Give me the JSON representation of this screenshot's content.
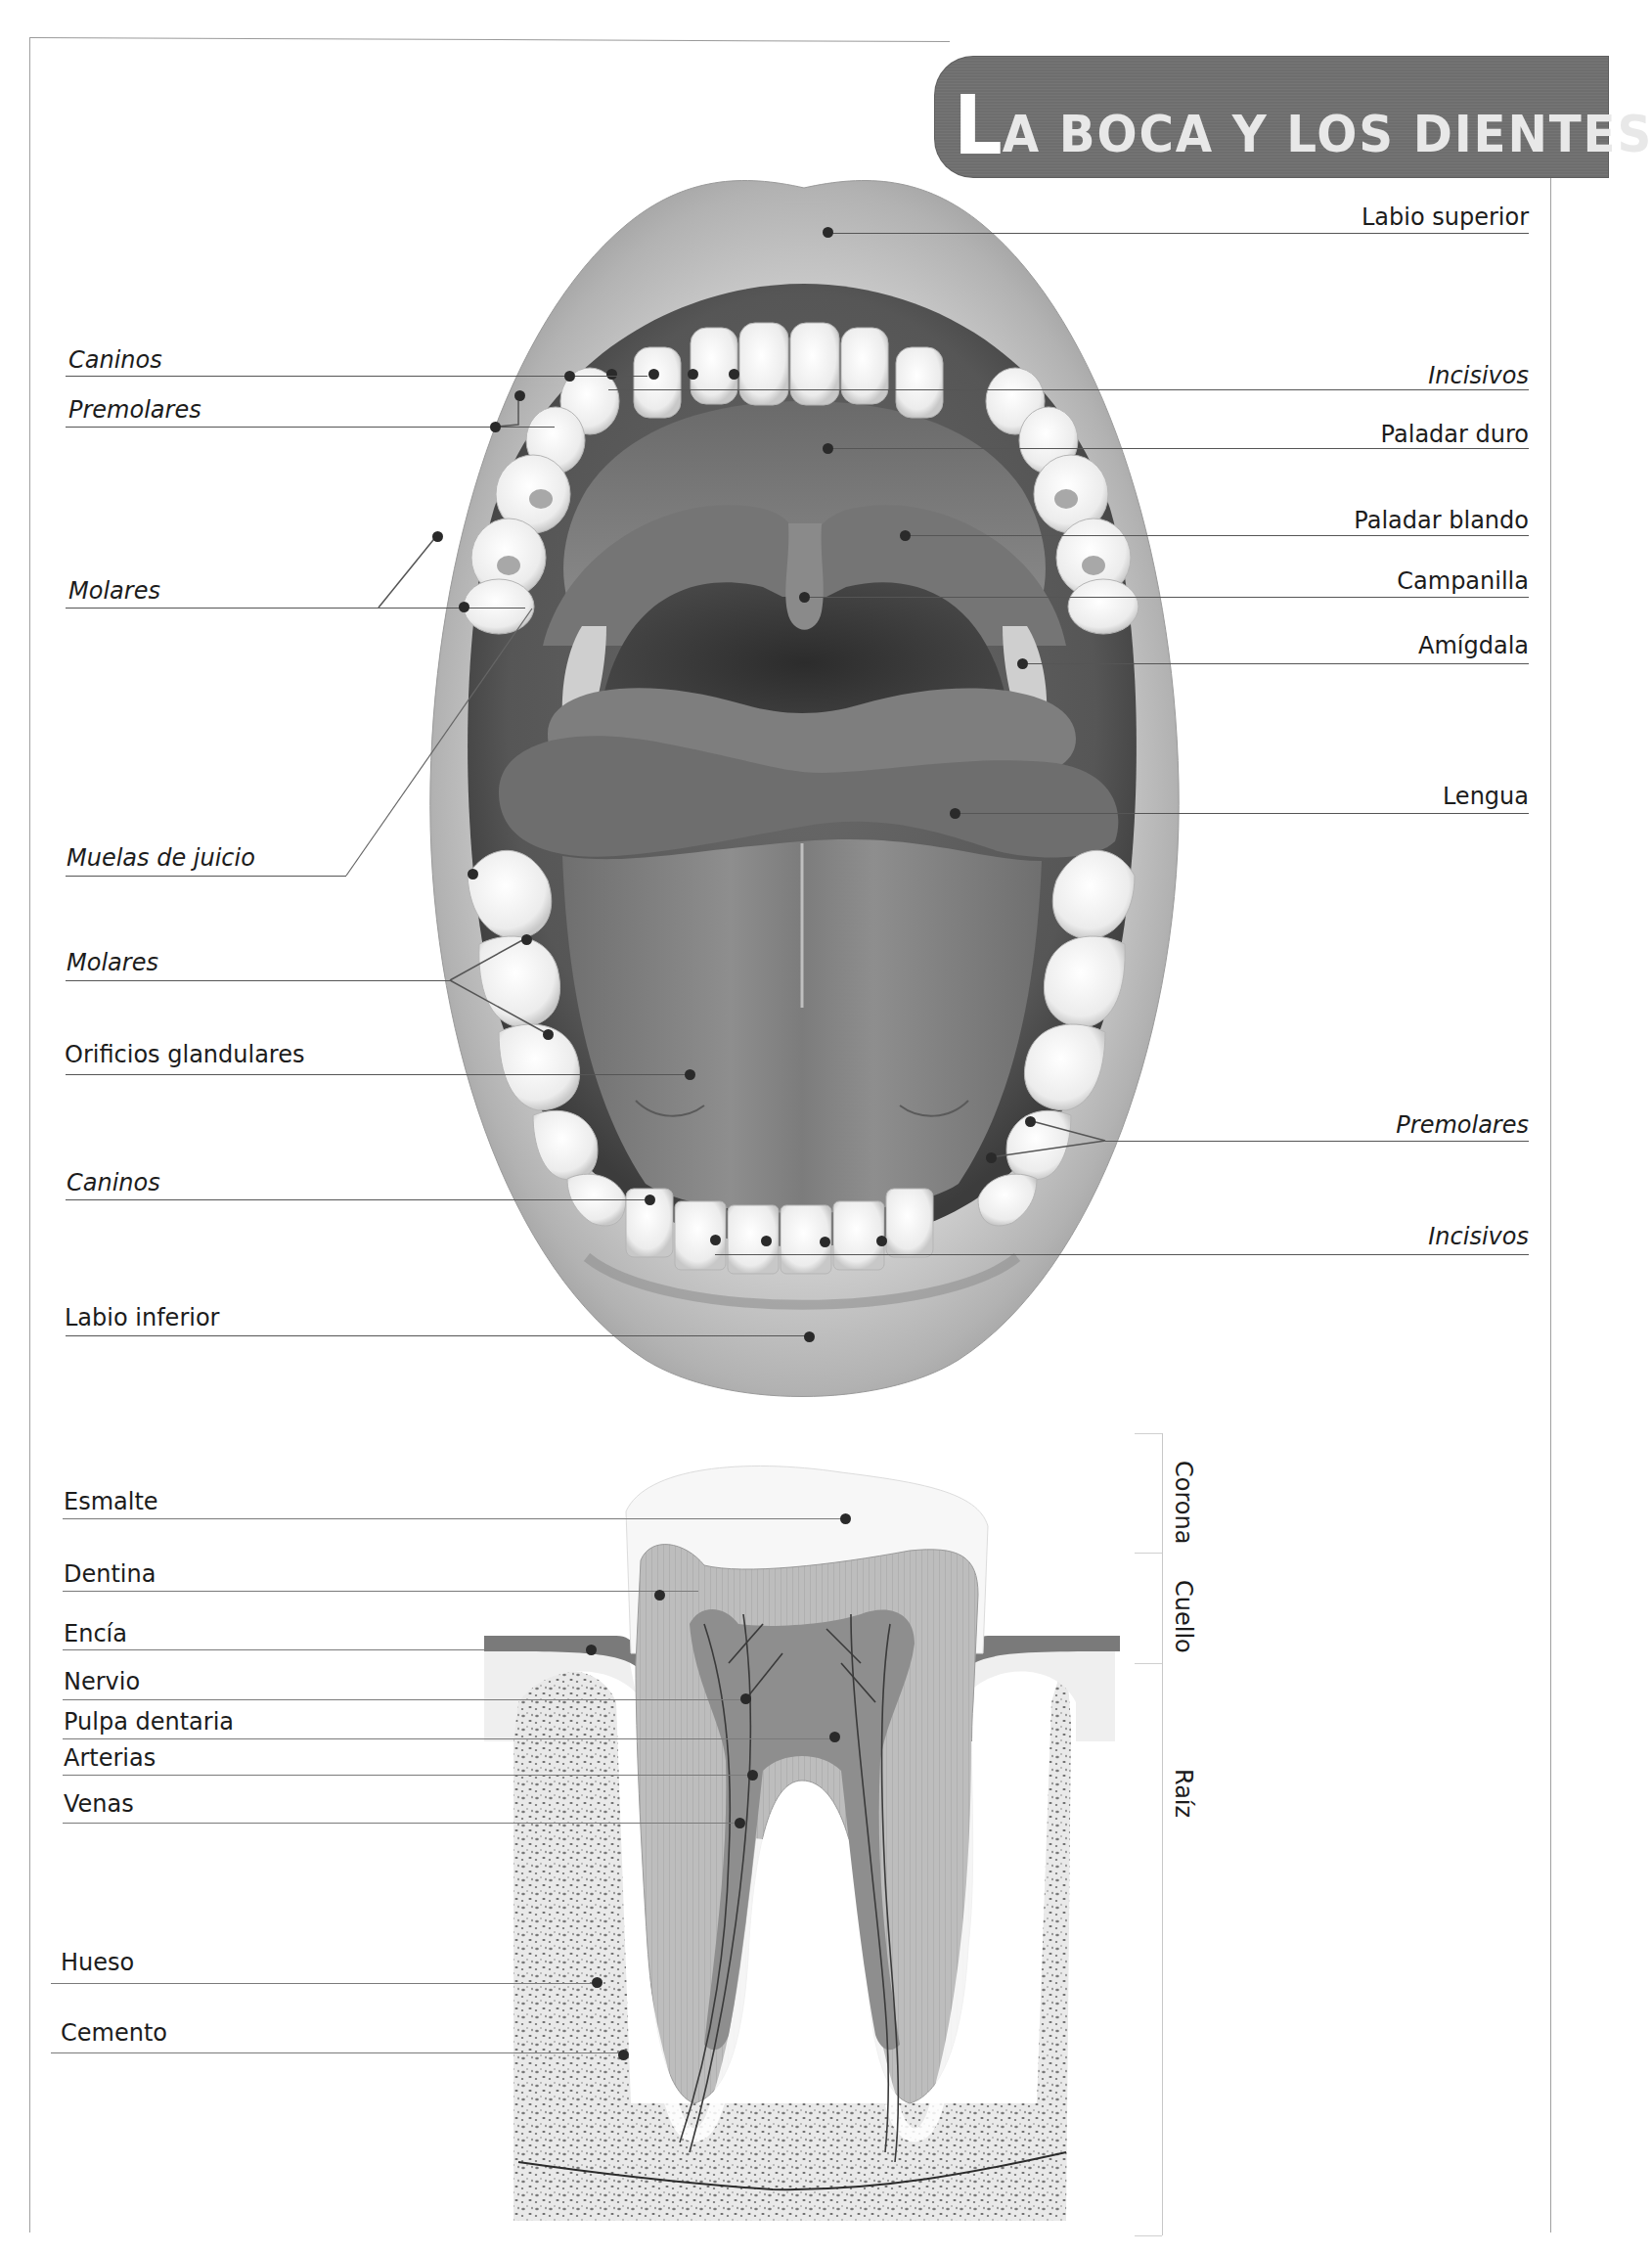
{
  "title": {
    "first_letter": "L",
    "rest": "A BOCA Y LOS DIENTES",
    "full": "LA BOCA Y LOS DIENTES"
  },
  "mouth_diagram": {
    "right_labels": [
      {
        "text": "Labio superior",
        "italic": false
      },
      {
        "text": "Incisivos",
        "italic": true
      },
      {
        "text": "Paladar duro",
        "italic": false
      },
      {
        "text": "Paladar blando",
        "italic": false
      },
      {
        "text": "Campanilla",
        "italic": false
      },
      {
        "text": "Amígdala",
        "italic": false
      },
      {
        "text": "Lengua",
        "italic": false
      },
      {
        "text": "Premolares",
        "italic": true
      },
      {
        "text": "Incisivos",
        "italic": true
      }
    ],
    "left_labels": [
      {
        "text": "Caninos",
        "italic": true
      },
      {
        "text": "Premolares",
        "italic": true
      },
      {
        "text": "Molares",
        "italic": true
      },
      {
        "text": "Muelas de juicio",
        "italic": true
      },
      {
        "text": "Molares",
        "italic": true
      },
      {
        "text": "Orificios glandulares",
        "italic": false
      },
      {
        "text": "Caninos",
        "italic": true
      },
      {
        "text": "Labio inferior",
        "italic": false
      }
    ]
  },
  "tooth_diagram": {
    "left_labels": [
      {
        "text": "Esmalte"
      },
      {
        "text": "Dentina"
      },
      {
        "text": "Encía"
      },
      {
        "text": "Nervio"
      },
      {
        "text": "Pulpa dentaria"
      },
      {
        "text": "Arterias"
      },
      {
        "text": "Venas"
      },
      {
        "text": "Hueso"
      },
      {
        "text": "Cemento"
      }
    ],
    "sections": [
      {
        "text": "Corona"
      },
      {
        "text": "Cuello"
      },
      {
        "text": "Raíz"
      }
    ]
  },
  "colors": {
    "title_bg": "#6e6e6e",
    "title_text": "#e8e8e8",
    "lip": "#bdbdbd",
    "gum": "#8a8a8a",
    "throat": "#3a3a3a",
    "tooth": "#f4f4f4",
    "leader": "#555555"
  }
}
